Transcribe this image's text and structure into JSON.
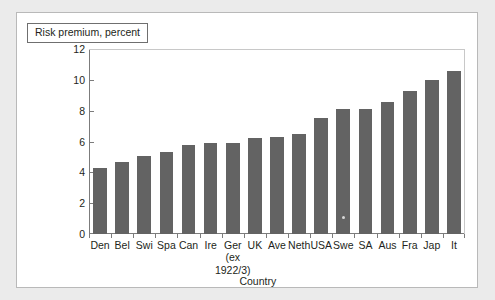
{
  "panel": {
    "title": "Risk premium, percent"
  },
  "chart_data": {
    "type": "bar",
    "title": "Risk premium, percent",
    "xlabel": "Country",
    "ylabel": "Risk premium, percent",
    "ylim": [
      0,
      12
    ],
    "yticks": [
      0,
      2,
      4,
      6,
      8,
      10,
      12
    ],
    "grid": false,
    "legend": null,
    "categories": [
      "Den",
      "Bel",
      "Swi",
      "Spa",
      "Can",
      "Ire",
      "Ger",
      "UK",
      "Ave",
      "Neth",
      "USA",
      "Swe",
      "SA",
      "Aus",
      "Fra",
      "Jap",
      "It"
    ],
    "category_sublabels": {
      "Ger": [
        "(ex",
        "1922/3)"
      ]
    },
    "values": [
      4.3,
      4.7,
      5.05,
      5.3,
      5.75,
      5.9,
      5.9,
      6.25,
      6.3,
      6.5,
      7.5,
      8.1,
      8.1,
      8.55,
      9.25,
      10.0,
      10.6
    ],
    "series_color": "#636363"
  }
}
